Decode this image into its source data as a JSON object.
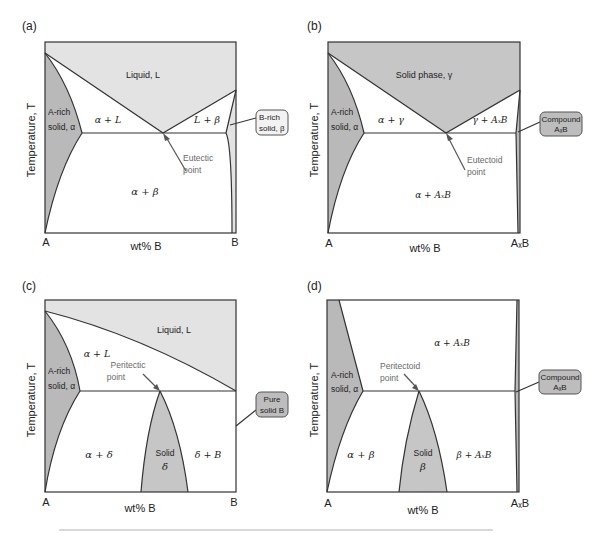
{
  "figure": {
    "panels": [
      {
        "id": "a",
        "tag": "(a)",
        "y_axis": "Temperature, T",
        "x_axis": "wt% B",
        "x_left": "A",
        "x_right": "B",
        "top_region": "Liquid, L",
        "left_solid": [
          "A-rich",
          "solid, α"
        ],
        "region_upper_left": "α + L",
        "region_upper_right": "L + β",
        "region_lower": "α + β",
        "point_label": [
          "Eutectic",
          "point"
        ],
        "callout": [
          "B-rich",
          "solid, β"
        ]
      },
      {
        "id": "b",
        "tag": "(b)",
        "y_axis": "Temperature, T",
        "x_axis": "wt% B",
        "x_left": "A",
        "x_right": "AₓB",
        "top_region": "Solid phase, γ",
        "left_solid": [
          "A-rich",
          "solid, α"
        ],
        "region_upper_left": "α + γ",
        "region_upper_right": "γ + AₓB",
        "region_lower": "α + AₓB",
        "point_label": [
          "Eutectoid",
          "point"
        ],
        "callout": [
          "Compound",
          "AₓB"
        ]
      },
      {
        "id": "c",
        "tag": "(c)",
        "y_axis": "Temperature, T",
        "x_axis": "wt% B",
        "x_left": "A",
        "x_right": "B",
        "top_region": "Liquid, L",
        "left_solid": [
          "A-rich",
          "solid, α"
        ],
        "region_upper_left": "α + L",
        "region_lower_left": "α + δ",
        "region_lower_mid": [
          "Solid",
          "δ"
        ],
        "region_lower_right": "δ + B",
        "point_label": [
          "Peritectic",
          "point"
        ],
        "callout": [
          "Pure",
          "solid B"
        ]
      },
      {
        "id": "d",
        "tag": "(d)",
        "y_axis": "Temperature, T",
        "x_axis": "wt% B",
        "x_left": "A",
        "x_right": "AₓB",
        "top_region": "α + AₓB",
        "left_solid": [
          "A-rich",
          "solid, α"
        ],
        "region_lower_left": "α + β",
        "region_lower_mid": [
          "Solid",
          "β"
        ],
        "region_lower_right": "β + AₓB",
        "point_label": [
          "Peritectoid",
          "point"
        ],
        "callout": [
          "Compound",
          "AₓB"
        ]
      }
    ]
  },
  "colors": {
    "light_fill": "#e3e3e3",
    "dark_fill": "#b9b9b9",
    "line": "#333333",
    "annotation": "#6a6a6a",
    "separator": "#cccccc"
  }
}
